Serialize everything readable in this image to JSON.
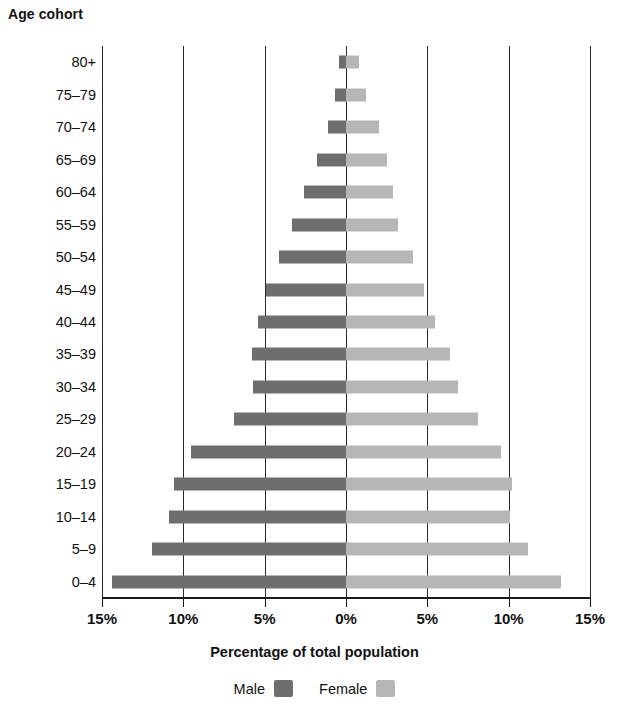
{
  "axis_titles": {
    "y": "Age cohort",
    "x": "Percentage of total population"
  },
  "legend": {
    "male_label": "Male",
    "female_label": "Female"
  },
  "colors": {
    "male": "#6e6e6e",
    "female": "#b6b6b6",
    "axis": "#1a1a1a",
    "grid": "#2b2b2b",
    "background": "#ffffff"
  },
  "x_ticks": [
    {
      "label": "15%",
      "value": -15
    },
    {
      "label": "10%",
      "value": -10
    },
    {
      "label": "5%",
      "value": -5
    },
    {
      "label": "0%",
      "value": 0
    },
    {
      "label": "5%",
      "value": 5
    },
    {
      "label": "10%",
      "value": 10
    },
    {
      "label": "15%",
      "value": 15
    }
  ],
  "chart_data": {
    "type": "bar",
    "subtype": "population-pyramid",
    "title": "",
    "xlabel": "Percentage of total population",
    "ylabel": "Age cohort",
    "xlim": [
      -15,
      15
    ],
    "grid": true,
    "legend_position": "bottom",
    "orientation": "horizontal",
    "categories": [
      "80+",
      "75–79",
      "70–74",
      "65–69",
      "60–64",
      "55–59",
      "50–54",
      "45–49",
      "40–44",
      "35–39",
      "30–34",
      "25–29",
      "20–24",
      "15–19",
      "10–14",
      "5–9",
      "0–4"
    ],
    "series": [
      {
        "name": "Male",
        "color": "#6e6e6e",
        "direction": "left",
        "values": [
          0.4,
          0.7,
          1.1,
          1.8,
          2.6,
          3.3,
          4.1,
          4.9,
          5.4,
          5.8,
          5.7,
          6.9,
          9.5,
          10.6,
          10.9,
          11.9,
          14.4
        ]
      },
      {
        "name": "Female",
        "color": "#b6b6b6",
        "direction": "right",
        "values": [
          0.8,
          1.2,
          2.0,
          2.5,
          2.9,
          3.2,
          4.1,
          4.8,
          5.5,
          6.4,
          6.9,
          8.1,
          9.5,
          10.2,
          10.1,
          11.2,
          13.2
        ]
      }
    ]
  }
}
